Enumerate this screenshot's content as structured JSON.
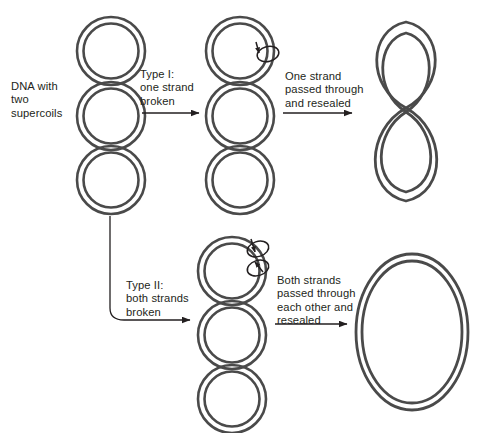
{
  "figure": {
    "width": 488,
    "height": 433,
    "background": "#ffffff",
    "stroke_color": "#4a4a4a",
    "text_color": "#231f20"
  },
  "labels": {
    "start": "DNA with\ntwo\nsupercoils",
    "type_one": "Type I:\none strand\nbroken",
    "type_one_result": "One strand\npassed through\nand resealed",
    "type_two": "Type II:\nboth strands\nbroken",
    "type_two_result": "Both strands\npassed through\neach other and\nresealed"
  },
  "structures": [
    {
      "name": "supercoiled-dna-start",
      "description": "Double-stranded circular DNA with two supercoils shown as three stacked interlocking circles",
      "coil_count": 3,
      "supercoils": 2,
      "nicks": 0
    },
    {
      "name": "supercoiled-dna-type1-nicked",
      "description": "Same supercoiled DNA with one strand nicked at the top coil",
      "coil_count": 3,
      "supercoils": 2,
      "nicks": 1
    },
    {
      "name": "figure-eight-dna",
      "description": "Partially relaxed DNA with one remaining supercoil forming a figure eight",
      "coil_count": 2,
      "supercoils": 1,
      "nicks": 0
    },
    {
      "name": "supercoiled-dna-type2-nicked",
      "description": "Same supercoiled DNA with both strands nicked at the top coil",
      "coil_count": 3,
      "supercoils": 2,
      "nicks": 2
    },
    {
      "name": "relaxed-circular-dna",
      "description": "Fully relaxed double-stranded circular DNA",
      "coil_count": 1,
      "supercoils": 0,
      "nicks": 0
    }
  ],
  "arrows": [
    {
      "name": "arrow-type-one",
      "from": "supercoiled-dna-start",
      "to": "supercoiled-dna-type1-nicked"
    },
    {
      "name": "arrow-type-one-result",
      "from": "supercoiled-dna-type1-nicked",
      "to": "figure-eight-dna"
    },
    {
      "name": "arrow-type-two",
      "from": "supercoiled-dna-start",
      "to": "supercoiled-dna-type2-nicked",
      "style": "elbow"
    },
    {
      "name": "arrow-type-two-result",
      "from": "supercoiled-dna-type2-nicked",
      "to": "relaxed-circular-dna"
    }
  ]
}
